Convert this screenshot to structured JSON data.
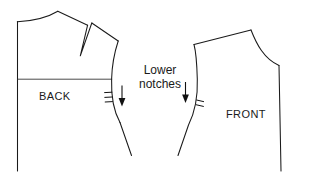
{
  "diagram": {
    "title": "Lower notches",
    "background_color": "#ffffff",
    "line_color": "#1a1a1a",
    "labels": {
      "back_piece": "BACK",
      "front_piece": "FRONT",
      "annotation_line_1": "Lower",
      "annotation_line_2": "notches"
    },
    "pieces": [
      {
        "name": "back-bodice",
        "label": "BACK",
        "features": [
          "center-back-line",
          "back-neckline",
          "shoulder-seam",
          "shoulder-dart",
          "back-armhole",
          "chest-line",
          "side-seam"
        ]
      },
      {
        "name": "front-bodice",
        "label": "FRONT",
        "features": [
          "shoulder-seam",
          "front-neckline",
          "center-front-line",
          "front-armhole",
          "side-seam"
        ]
      }
    ],
    "notches": [
      {
        "name": "back-armhole-notch",
        "piece": "back-bodice",
        "tick_count": 2,
        "arrow_direction": "down"
      },
      {
        "name": "front-armhole-notch",
        "piece": "front-bodice",
        "tick_count": 1,
        "arrow_direction": "down"
      }
    ]
  }
}
